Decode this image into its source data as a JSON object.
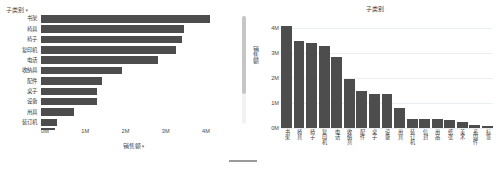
{
  "colors": {
    "bar": "#4d4d4d",
    "axis_text": "#4a4a4a",
    "grid": "#eceff1",
    "scrollbar_track": "#f2f2f2",
    "scrollbar_thumb": "#c6c6c6",
    "footer_rule": "#9b9b9b"
  },
  "left_panel": {
    "field_header": "子类别",
    "field_caret": "▾",
    "axis_title": "销售额",
    "axis_title_caret": "▾"
  },
  "right_panel": {
    "title": "子类别",
    "axis_title": "销售额"
  },
  "chart_data": [
    {
      "type": "bar",
      "orientation": "horizontal",
      "title": "",
      "xlabel": "销售额",
      "ylabel": "子类别",
      "xlim": [
        0,
        4400000
      ],
      "xticks": [
        "0M",
        "1M",
        "2M",
        "3M",
        "4M"
      ],
      "xtick_values": [
        0,
        1000000,
        2000000,
        3000000,
        4000000
      ],
      "grid": false,
      "legend": "none",
      "categories": [
        "书架",
        "椅具",
        "椅子",
        "复印机",
        "电话",
        "收纳具",
        "配件",
        "桌子",
        "设备",
        "用具",
        "装订机"
      ],
      "values": [
        4100000,
        3480000,
        3420000,
        3270000,
        2840000,
        1980000,
        1480000,
        1370000,
        1370000,
        810000,
        380000
      ],
      "truncated_rows": 6,
      "note": "list scrolls — additional sub-categories below are cut off"
    },
    {
      "type": "bar",
      "orientation": "vertical",
      "title": "子类别",
      "xlabel": "",
      "ylabel": "销售额",
      "ylim": [
        0,
        4400000
      ],
      "yticks": [
        "0M",
        "1M",
        "2M",
        "3M",
        "4M"
      ],
      "ytick_values": [
        0,
        1000000,
        2000000,
        3000000,
        4000000
      ],
      "grid": true,
      "legend": "none",
      "categories": [
        "书架",
        "椅具",
        "椅子",
        "复印机",
        "电话",
        "收纳具",
        "配件",
        "桌子",
        "设备",
        "用具",
        "装订机",
        "信封",
        "用品",
        "纸张",
        "美术",
        "系固件",
        "标签"
      ],
      "values": [
        4100000,
        3480000,
        3420000,
        3270000,
        2840000,
        1980000,
        1480000,
        1370000,
        1370000,
        810000,
        380000,
        350000,
        350000,
        340000,
        260000,
        140000,
        100000
      ]
    }
  ]
}
